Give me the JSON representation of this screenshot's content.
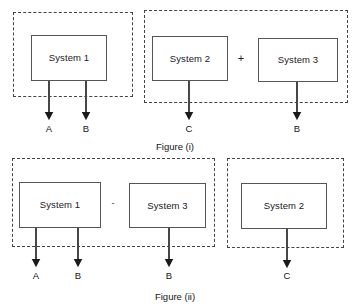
{
  "diagram": {
    "stroke_color": "#555555",
    "dashed_color": "#444444",
    "text_color": "#1a1a1a",
    "background": "#ffffff"
  },
  "figures": [
    {
      "id": "figure-i",
      "caption": "Figure (i)",
      "groups": [
        {
          "id": "fig1-group-left",
          "blocks": [
            {
              "id": "fig1-system-1",
              "label": "System 1"
            }
          ],
          "outputs": [
            {
              "id": "fig1-out-a",
              "label": "A"
            },
            {
              "id": "fig1-out-b",
              "label": "B"
            }
          ]
        },
        {
          "id": "fig1-group-right",
          "operator": "+",
          "blocks": [
            {
              "id": "fig1-system-2",
              "label": "System 2"
            },
            {
              "id": "fig1-system-3",
              "label": "System 3"
            }
          ],
          "outputs": [
            {
              "id": "fig1-out-c",
              "label": "C"
            },
            {
              "id": "fig1-out-b2",
              "label": "B"
            }
          ]
        }
      ]
    },
    {
      "id": "figure-ii",
      "caption": "Figure (ii)",
      "groups": [
        {
          "id": "fig2-group-left",
          "operator": "-",
          "blocks": [
            {
              "id": "fig2-system-1",
              "label": "System 1"
            },
            {
              "id": "fig2-system-3",
              "label": "System 3"
            }
          ],
          "outputs": [
            {
              "id": "fig2-out-a",
              "label": "A"
            },
            {
              "id": "fig2-out-b",
              "label": "B"
            },
            {
              "id": "fig2-out-b2",
              "label": "B"
            }
          ]
        },
        {
          "id": "fig2-group-right",
          "blocks": [
            {
              "id": "fig2-system-2",
              "label": "System 2"
            }
          ],
          "outputs": [
            {
              "id": "fig2-out-c",
              "label": "C"
            }
          ]
        }
      ]
    }
  ]
}
